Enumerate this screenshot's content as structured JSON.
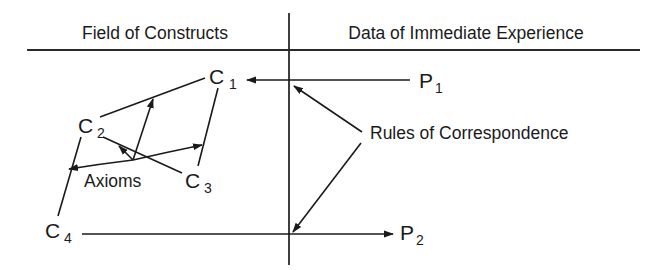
{
  "headers": {
    "left": "Field of Constructs",
    "right": "Data of Immediate Experience"
  },
  "constructs": [
    {
      "id": "C1",
      "letter": "C",
      "subscript": "1"
    },
    {
      "id": "C2",
      "letter": "C",
      "subscript": "2"
    },
    {
      "id": "C3",
      "letter": "C",
      "subscript": "3"
    },
    {
      "id": "C4",
      "letter": "C",
      "subscript": "4"
    }
  ],
  "observations": [
    {
      "id": "P1",
      "letter": "P",
      "subscript": "1"
    },
    {
      "id": "P2",
      "letter": "P",
      "subscript": "2"
    }
  ],
  "annotations": {
    "axioms": "Axioms",
    "rules": "Rules of Correspondence"
  },
  "colors": {
    "ink": "#1a1a1a",
    "background": "#ffffff"
  }
}
